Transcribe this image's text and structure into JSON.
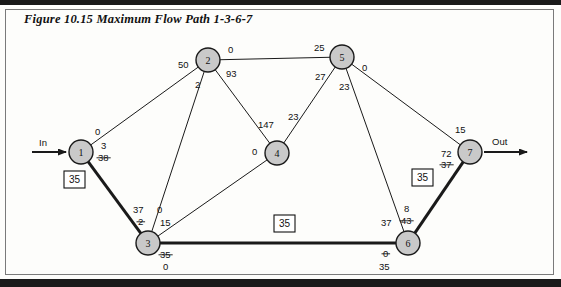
{
  "figure": {
    "title": "Figure 10.15    Maximum Flow Path 1-3-6-7",
    "caption_number": "10.15",
    "caption_text": "Maximum Flow Path 1-3-6-7"
  },
  "terminals": {
    "in_label": "In",
    "out_label": "Out"
  },
  "colors": {
    "node_fill": "#c9c9c9",
    "node_stroke": "#1a1a1a",
    "edge": "#1a1a1a",
    "highlight_path": "#1a1a1a",
    "page_background": "#fdfdfb",
    "text": "#111111"
  },
  "nodes": [
    {
      "id": "1",
      "label": "1",
      "x": 81,
      "y": 152
    },
    {
      "id": "2",
      "label": "2",
      "x": 208,
      "y": 60
    },
    {
      "id": "3",
      "label": "3",
      "x": 148,
      "y": 243
    },
    {
      "id": "4",
      "label": "4",
      "x": 277,
      "y": 153
    },
    {
      "id": "5",
      "label": "5",
      "x": 342,
      "y": 57
    },
    {
      "id": "6",
      "label": "6",
      "x": 408,
      "y": 243
    },
    {
      "id": "7",
      "label": "7",
      "x": 470,
      "y": 152
    }
  ],
  "edges": [
    {
      "from": "1",
      "to": "2",
      "highlighted": false
    },
    {
      "from": "1",
      "to": "3",
      "highlighted": true
    },
    {
      "from": "2",
      "to": "3",
      "highlighted": false
    },
    {
      "from": "2",
      "to": "4",
      "highlighted": false
    },
    {
      "from": "2",
      "to": "5",
      "highlighted": false
    },
    {
      "from": "3",
      "to": "4",
      "highlighted": false
    },
    {
      "from": "3",
      "to": "6",
      "highlighted": true
    },
    {
      "from": "4",
      "to": "5",
      "highlighted": false
    },
    {
      "from": "5",
      "to": "6",
      "highlighted": false
    },
    {
      "from": "5",
      "to": "7",
      "highlighted": false
    },
    {
      "from": "6",
      "to": "7",
      "highlighted": true
    }
  ],
  "edge_labels": [
    {
      "name": "label-node1-to-node2",
      "text": "0",
      "x": 95,
      "y": 135,
      "struck": false
    },
    {
      "name": "label-node1-to-node3-current",
      "text": "3",
      "x": 101,
      "y": 149,
      "struck": false
    },
    {
      "name": "label-node1-to-node3-crossed",
      "text": "38",
      "x": 98,
      "y": 161,
      "struck": true
    },
    {
      "name": "label-node2-from-node1",
      "text": "50",
      "x": 178,
      "y": 68,
      "struck": false
    },
    {
      "name": "label-node2-to-node5",
      "text": "0",
      "x": 228,
      "y": 53,
      "struck": false
    },
    {
      "name": "label-node2-to-node4",
      "text": "93",
      "x": 226,
      "y": 77,
      "struck": false
    },
    {
      "name": "label-node2-to-node3",
      "text": "2",
      "x": 195,
      "y": 88,
      "struck": false
    },
    {
      "name": "label-node4-from-node2",
      "text": "147",
      "x": 258,
      "y": 128,
      "struck": false
    },
    {
      "name": "label-node4-to-node5",
      "text": "23",
      "x": 288,
      "y": 120,
      "struck": false
    },
    {
      "name": "label-node4-from-node3",
      "text": "0",
      "x": 252,
      "y": 155,
      "struck": false
    },
    {
      "name": "label-node5-from-node2",
      "text": "25",
      "x": 314,
      "y": 51,
      "struck": false
    },
    {
      "name": "label-node5-to-node7",
      "text": "0",
      "x": 362,
      "y": 71,
      "struck": false
    },
    {
      "name": "label-node5-from-node4",
      "text": "27",
      "x": 315,
      "y": 80,
      "struck": false
    },
    {
      "name": "label-node5-to-node6",
      "text": "23",
      "x": 339,
      "y": 90,
      "struck": false
    },
    {
      "name": "label-node3-from-node1",
      "text": "37",
      "x": 133,
      "y": 213,
      "struck": false
    },
    {
      "name": "label-node3-from-node1-crossed",
      "text": "2",
      "x": 138,
      "y": 225,
      "struck": true
    },
    {
      "name": "label-node3-from-node2",
      "text": "0",
      "x": 157,
      "y": 213,
      "struck": false
    },
    {
      "name": "label-node3-to-node4",
      "text": "15",
      "x": 160,
      "y": 226,
      "struck": false
    },
    {
      "name": "label-node3-to-node6-crossed",
      "text": "35",
      "x": 160,
      "y": 258,
      "struck": true
    },
    {
      "name": "label-node3-to-node6-current",
      "text": "0",
      "x": 163,
      "y": 270,
      "struck": false
    },
    {
      "name": "label-node6-from-node5",
      "text": "37",
      "x": 381,
      "y": 226,
      "struck": false
    },
    {
      "name": "label-node6-to-node7",
      "text": "8",
      "x": 404,
      "y": 212,
      "struck": false
    },
    {
      "name": "label-node6-to-node7-crossed",
      "text": "43",
      "x": 401,
      "y": 224,
      "struck": true
    },
    {
      "name": "label-node6-from-node3-crossed",
      "text": "0",
      "x": 383,
      "y": 257,
      "struck": true
    },
    {
      "name": "label-node6-from-node3-current",
      "text": "35",
      "x": 379,
      "y": 270,
      "struck": false
    },
    {
      "name": "label-node7-from-node5",
      "text": "15",
      "x": 455,
      "y": 133,
      "struck": false
    },
    {
      "name": "label-node7-from-node6",
      "text": "72",
      "x": 441,
      "y": 157,
      "struck": false
    },
    {
      "name": "label-node7-from-node6-crossed",
      "text": "37",
      "x": 441,
      "y": 168,
      "struck": true
    }
  ],
  "boxed_labels": [
    {
      "name": "flow-box-path-1-3",
      "text": "35",
      "x": 64,
      "y": 171
    },
    {
      "name": "flow-box-path-3-6",
      "text": "35",
      "x": 274,
      "y": 215
    },
    {
      "name": "flow-box-path-6-7",
      "text": "35",
      "x": 412,
      "y": 169
    }
  ]
}
